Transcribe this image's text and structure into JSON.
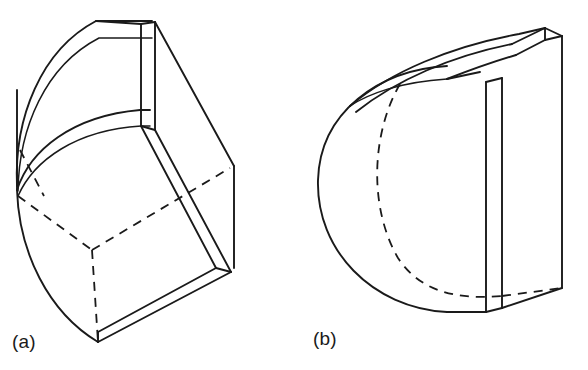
{
  "figure": {
    "background_color": "#ffffff",
    "line_color": "#1a1a1a",
    "width": 588,
    "height": 370,
    "captions": [
      {
        "id": "a",
        "label": "(a)",
        "x": 12,
        "y": 331
      },
      {
        "id": "b",
        "label": "(b)",
        "x": 313,
        "y": 328
      }
    ],
    "panels": [
      {
        "id": "panel-a",
        "caption": "(a)",
        "description": "Quarter-sphere solid with a rectangular slot cut, shown tilted, with hidden edges dashed",
        "line_style_solid": "solid",
        "line_style_hidden": "dashed"
      },
      {
        "id": "panel-b",
        "caption": "(b)",
        "description": "Half-sphere solid truncated by a rectangular block with a top groove, hidden circular edge dashed",
        "line_style_solid": "solid",
        "line_style_hidden": "dashed"
      }
    ]
  }
}
